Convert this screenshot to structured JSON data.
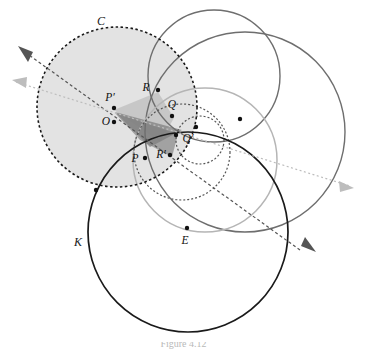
{
  "figure": {
    "kind": "geometry-diagram",
    "caption_fragment": "Figure 4.12",
    "background_color": "#ffffff"
  },
  "palette": {
    "black": "#1a1a1a",
    "dark_gray": "#555555",
    "mid_gray": "#6e6e6e",
    "light_gray": "#b5b5b5",
    "pale_gray": "#c9c9c9",
    "disk_fill": "#d9d9d9",
    "wedge_fill_light": "#bdbdbd",
    "wedge_fill_dark": "#8f8f8f",
    "dot_color": "#111111"
  },
  "circles": [
    {
      "name": "circle-C",
      "label": "C",
      "label_x": 101,
      "label_y": 22,
      "cx": 117,
      "cy": 107,
      "r": 80,
      "stroke": "#1a1a1a",
      "stroke_width": 1.6,
      "dash": "2.5 2.5",
      "fill": "#d9d9d9",
      "fill_opacity": 0.75
    },
    {
      "name": "circle-K",
      "label": "K",
      "label_x": 78,
      "label_y": 243,
      "cx": 188,
      "cy": 232,
      "r": 100,
      "stroke": "#1a1a1a",
      "stroke_width": 1.7,
      "dash": "none",
      "fill": "none",
      "fill_opacity": 0
    },
    {
      "name": "circle-image-light",
      "label": "",
      "label_x": 0,
      "label_y": 0,
      "cx": 205,
      "cy": 160,
      "r": 72,
      "stroke": "#b5b5b5",
      "stroke_width": 1.5,
      "dash": "none",
      "fill": "none",
      "fill_opacity": 0
    },
    {
      "name": "circle-large-gray",
      "label": "",
      "label_x": 0,
      "label_y": 0,
      "cx": 245,
      "cy": 132,
      "r": 100,
      "stroke": "#6e6e6e",
      "stroke_width": 1.4,
      "dash": "none",
      "fill": "none",
      "fill_opacity": 0
    },
    {
      "name": "circle-upper-gray",
      "label": "",
      "label_x": 0,
      "label_y": 0,
      "cx": 214,
      "cy": 76,
      "r": 66,
      "stroke": "#6e6e6e",
      "stroke_width": 1.4,
      "dash": "none",
      "fill": "none",
      "fill_opacity": 0
    },
    {
      "name": "circle-small-dashed",
      "label": "",
      "label_x": 0,
      "label_y": 0,
      "cx": 200,
      "cy": 140,
      "r": 24,
      "stroke": "#555555",
      "stroke_width": 1.2,
      "dash": "2 2",
      "fill": "none",
      "fill_opacity": 0
    },
    {
      "name": "circle-med-dashed",
      "label": "",
      "label_x": 0,
      "label_y": 0,
      "cx": 182,
      "cy": 152,
      "r": 48,
      "stroke": "#555555",
      "stroke_width": 1.2,
      "dash": "2 2",
      "fill": "none",
      "fill_opacity": 0
    }
  ],
  "points": [
    {
      "name": "point-P-prime",
      "label": "P′",
      "x": 114,
      "y": 108,
      "label_x": 110,
      "label_y": 98,
      "anchor": "middle"
    },
    {
      "name": "point-O",
      "label": "O",
      "x": 114,
      "y": 122,
      "label_x": 106,
      "label_y": 122,
      "anchor": "middle"
    },
    {
      "name": "point-R",
      "label": "R",
      "x": 158,
      "y": 90,
      "label_x": 146,
      "label_y": 88,
      "anchor": "middle"
    },
    {
      "name": "point-Q",
      "label": "Q",
      "x": 172,
      "y": 116,
      "label_x": 172,
      "label_y": 105,
      "anchor": "middle"
    },
    {
      "name": "point-Q-prime",
      "label": "Q′",
      "x": 176,
      "y": 135,
      "label_x": 188,
      "label_y": 139,
      "anchor": "middle"
    },
    {
      "name": "point-R-prime",
      "label": "R′",
      "x": 170,
      "y": 155,
      "label_x": 161,
      "label_y": 155,
      "anchor": "middle"
    },
    {
      "name": "point-P",
      "label": "P",
      "x": 145,
      "y": 158,
      "label_x": 135,
      "label_y": 159,
      "anchor": "middle"
    },
    {
      "name": "point-E",
      "label": "E",
      "x": 187,
      "y": 228,
      "label_x": 185,
      "label_y": 241,
      "anchor": "middle"
    },
    {
      "name": "point-unlabeled-upper-right",
      "label": "",
      "x": 240,
      "y": 119,
      "label_x": 0,
      "label_y": 0,
      "anchor": "middle"
    },
    {
      "name": "point-unlabeled-on-K-left",
      "label": "",
      "x": 96,
      "y": 190,
      "label_x": 0,
      "label_y": 0,
      "anchor": "middle"
    },
    {
      "name": "point-unlabeled-center",
      "label": "",
      "x": 196,
      "y": 127,
      "label_x": 0,
      "label_y": 0,
      "anchor": "middle"
    }
  ],
  "rays": [
    {
      "name": "ray-through-R-dark",
      "x1": 300,
      "y1": 250,
      "x2": 22,
      "y2": 50,
      "stroke": "#555555",
      "dash": "3 2.5",
      "arrow_ends": "both",
      "arrow_color": "#555555"
    },
    {
      "name": "ray-through-Q-light",
      "x1": 16,
      "y1": 82,
      "x2": 350,
      "y2": 186,
      "stroke": "#bdbdbd",
      "dash": "2 2.5",
      "arrow_ends": "both",
      "arrow_color": "#bdbdbd"
    }
  ],
  "wedges": [
    {
      "name": "wedge-O-R-Q-light",
      "points": "114,110 158,92 174,118 160,142",
      "fill": "#bdbdbd",
      "opacity": 0.72
    },
    {
      "name": "wedge-O-Q-prime-R-prime-dark",
      "points": "115,113 178,134 172,157 140,140",
      "fill": "#8f8f8f",
      "opacity": 0.78
    },
    {
      "name": "wedge-O-mid-dark",
      "points": "115,112 182,130 150,147",
      "fill": "#7e7e7e",
      "opacity": 0.72
    }
  ],
  "arrowheads": [
    {
      "name": "arrowhead-upper-left",
      "x": 22,
      "y": 50,
      "angle": 215,
      "color": "#555555"
    },
    {
      "name": "arrowhead-mid-left",
      "x": 16,
      "y": 82,
      "angle": 197,
      "color": "#bdbdbd"
    },
    {
      "name": "arrowhead-right-light",
      "x": 350,
      "y": 186,
      "angle": 17,
      "color": "#bdbdbd"
    },
    {
      "name": "arrowhead-lower-right",
      "x": 312,
      "y": 248,
      "angle": 35,
      "color": "#555555"
    }
  ]
}
